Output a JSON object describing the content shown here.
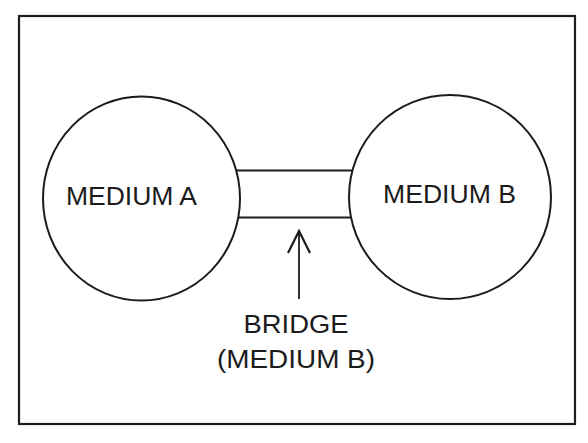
{
  "diagram": {
    "medium_a": {
      "label": "MEDIUM A"
    },
    "medium_b": {
      "label": "MEDIUM B"
    },
    "bridge": {
      "label_line1": "BRIDGE",
      "label_line2": "(MEDIUM B)"
    },
    "colors": {
      "stroke": "#1c1c1c",
      "background": "#ffffff"
    }
  }
}
